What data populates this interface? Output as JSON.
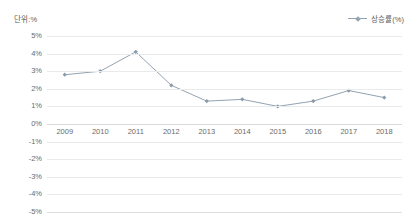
{
  "unit_label": "단위:%",
  "legend": {
    "series_label": "상승률(%)",
    "symbol": "line-diamond-marker",
    "position": "top-right"
  },
  "colors": {
    "series_line": "#93a3b1",
    "marker": "#8a9aa8",
    "gridline": "#e8eaec",
    "axis_text": "#6b6b6b",
    "unit_text": "#5d5d5d",
    "background": "#ffffff"
  },
  "chart_data": {
    "type": "line",
    "title": "",
    "subtitle": "",
    "xlabel": "",
    "ylabel": "",
    "unit": "%",
    "categories": [
      "2009",
      "2010",
      "2011",
      "2012",
      "2013",
      "2014",
      "2015",
      "2016",
      "2017",
      "2018"
    ],
    "series": [
      {
        "name": "상승률(%)",
        "values": [
          2.8,
          3.0,
          4.1,
          2.2,
          1.3,
          1.4,
          1.0,
          1.3,
          1.9,
          1.5
        ]
      }
    ],
    "ylim": [
      -5,
      5
    ],
    "yticks": [
      5,
      4,
      3,
      2,
      1,
      0,
      -1,
      -2,
      -3,
      -4,
      -5
    ],
    "ytick_labels": [
      "5%",
      "4%",
      "3%",
      "2%",
      "1%",
      "0%",
      "-1%",
      "-2%",
      "-3%",
      "-4%",
      "-5%"
    ],
    "grid": true,
    "legend_position": "top-right",
    "markers": true,
    "marker_shape": "diamond"
  }
}
